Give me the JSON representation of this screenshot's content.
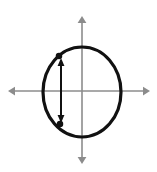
{
  "canvas": {
    "width": 157,
    "height": 172,
    "background_color": "#ffffff"
  },
  "figure": {
    "title": "",
    "colors": {
      "axis": "#8c8c8c",
      "circle": "#111111",
      "chord_arrow": "#111111",
      "point_marker": "#111111"
    }
  },
  "axes": {
    "origin": {
      "x": 82,
      "y": 91
    },
    "horizontal": {
      "name": "horizontal-axis",
      "x1": 8,
      "x2": 150,
      "y": 91,
      "stroke_width": 1.6,
      "arrow_left": true,
      "arrow_right": true,
      "label": ""
    },
    "vertical": {
      "name": "vertical-axis",
      "y1": 16,
      "y2": 164,
      "x": 82,
      "stroke_width": 1.6,
      "arrow_up": true,
      "arrow_down": true,
      "label": ""
    }
  },
  "circle": {
    "name": "circle-outline",
    "center_x": 82,
    "center_y": 92,
    "radius_x": 39,
    "radius_y": 45,
    "stroke_width": 3.2,
    "fill": "none",
    "label": ""
  },
  "chord": {
    "name": "vertical-chord-arrow",
    "x": 61,
    "y_top": 58,
    "y_bottom": 123,
    "stroke_width": 2.0,
    "double_headed": true,
    "label": ""
  },
  "points": [
    {
      "name": "chord-endpoint-top",
      "x": 59,
      "y": 56,
      "size": 4.2,
      "label": ""
    },
    {
      "name": "chord-endpoint-bottom",
      "x": 60,
      "y": 124,
      "size": 4.2,
      "label": ""
    }
  ],
  "arrowheads": {
    "axis_size": 7,
    "chord_size": 5.5
  }
}
